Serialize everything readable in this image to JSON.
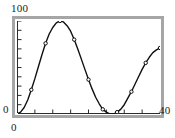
{
  "chart_data": {
    "type": "line",
    "title": "",
    "subtitle": "",
    "xlabel": "",
    "ylabel": "",
    "xlim": [
      0,
      40
    ],
    "ylim": [
      0,
      100
    ],
    "grid": false,
    "legend": null,
    "line_color": "#101010",
    "marker": "circle-open",
    "marker_color": "#101010",
    "frame_color": "#a6a6a6",
    "background": "#ffffff",
    "axis_labels": {
      "y_max": "100",
      "y_min": "0",
      "x_min": "0",
      "x_max": "40"
    },
    "y_ticks_count": 10,
    "x_ticks_count": 8,
    "x": [
      0,
      1,
      2,
      3,
      4,
      5,
      6,
      7,
      8,
      9,
      10,
      11,
      12,
      13,
      14,
      15,
      16,
      17,
      18,
      19,
      20,
      21,
      22,
      23,
      24,
      25,
      26,
      27,
      28,
      29,
      30,
      31,
      32,
      33,
      34,
      35,
      36,
      37,
      38,
      39,
      40
    ],
    "values": [
      0,
      2,
      7,
      15,
      26,
      38,
      51,
      64,
      76,
      86,
      93,
      98,
      100,
      99,
      95,
      89,
      80,
      70,
      59,
      48,
      37,
      27,
      18,
      11,
      5,
      2,
      0,
      0,
      2,
      5,
      10,
      17,
      24,
      32,
      40,
      48,
      55,
      61,
      66,
      69,
      71
    ],
    "marker_points": {
      "x": [
        0,
        4,
        8,
        12,
        16,
        20,
        24,
        28,
        32,
        36,
        40
      ],
      "values": [
        0,
        26,
        76,
        100,
        80,
        37,
        5,
        2,
        24,
        55,
        71
      ]
    },
    "series": [
      {
        "name": "",
        "values": [
          0,
          2,
          7,
          15,
          26,
          38,
          51,
          64,
          76,
          86,
          93,
          98,
          100,
          99,
          95,
          89,
          80,
          70,
          59,
          48,
          37,
          27,
          18,
          11,
          5,
          2,
          0,
          0,
          2,
          5,
          10,
          17,
          24,
          32,
          40,
          48,
          55,
          61,
          66,
          69,
          71
        ]
      }
    ]
  }
}
